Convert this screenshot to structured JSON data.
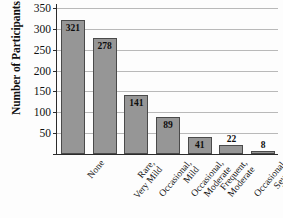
{
  "chart_data": {
    "type": "bar",
    "title": "",
    "xlabel": "",
    "ylabel": "Number of Participants",
    "categories": [
      "None",
      "Rare,\nVery Mild",
      "Occasional,\nMild",
      "Occasional,\nModerate",
      "Frequent,\nModerate",
      "Occasional,\nSevere",
      "Frequent,\nSevere"
    ],
    "values": [
      321,
      278,
      141,
      89,
      41,
      22,
      8
    ],
    "value_labels": [
      "321",
      "278",
      "141",
      "89",
      "41",
      "22",
      "8"
    ],
    "label_placement": [
      "inside",
      "inside",
      "inside",
      "inside",
      "inside",
      "outside",
      "outside"
    ],
    "ylim": [
      0,
      350
    ],
    "yticks": [
      0,
      50,
      100,
      150,
      200,
      250,
      300,
      350
    ],
    "ytick_labels": [
      "",
      "50",
      "100",
      "150",
      "200",
      "250",
      "300",
      "350"
    ],
    "grid": true,
    "grid_axis": "y",
    "legend": false,
    "bar_color": "#969696",
    "bar_edge_color": "#4a4a4a",
    "grid_color": "#b9b9b9",
    "axis_color": "#2b2b2b",
    "text_color": "#101010"
  }
}
